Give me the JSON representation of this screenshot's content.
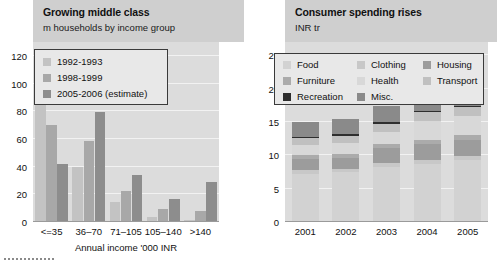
{
  "chart_data": [
    {
      "type": "bar",
      "panel": "left",
      "title": "Growing middle class",
      "subtitle": "m households by income group",
      "xlabel": "Annual income '000 INR",
      "ylabel": "",
      "ylim": [
        0,
        130
      ],
      "yticks": [
        0,
        20,
        40,
        60,
        80,
        100,
        120
      ],
      "grid": true,
      "legend_position": "top-left",
      "categories": [
        "<=35",
        "36–70",
        "71–105",
        "105–140",
        ">140"
      ],
      "series": [
        {
          "name": "1992-1993",
          "color": "#c3c3c3",
          "values": [
            92,
            39,
            14,
            3,
            1
          ]
        },
        {
          "name": "1998-1999",
          "color": "#a8a8a8",
          "values": [
            69,
            58,
            22,
            9,
            7
          ]
        },
        {
          "name": "2005-2006 (estimate)",
          "color": "#8d8d8d",
          "values": [
            41,
            79,
            33,
            16,
            28
          ]
        }
      ]
    },
    {
      "type": "bar",
      "panel": "right",
      "stacked": true,
      "title": "Consumer spending rises",
      "subtitle": "INR tr",
      "xlabel": "",
      "ylabel": "",
      "ylim": [
        0,
        27
      ],
      "yticks": [
        0,
        5,
        10,
        15,
        20,
        25
      ],
      "grid": true,
      "legend_position": "top",
      "categories": [
        "2001",
        "2002",
        "2003",
        "2004",
        "2005"
      ],
      "series": [
        {
          "name": "Food",
          "color": "#d2d2d2",
          "values": [
            7.1,
            7.3,
            8.1,
            8.6,
            9.1
          ]
        },
        {
          "name": "Clothing",
          "color": "#c8c8c8",
          "values": [
            0.5,
            0.5,
            0.6,
            0.6,
            0.6
          ]
        },
        {
          "name": "Housing",
          "color": "#9c9c9c",
          "values": [
            1.7,
            1.7,
            2.2,
            2.3,
            2.4
          ]
        },
        {
          "name": "Furniture",
          "color": "#ababab",
          "values": [
            0.6,
            0.6,
            0.7,
            0.7,
            0.8
          ]
        },
        {
          "name": "Health",
          "color": "#d8d8d8",
          "values": [
            1.5,
            1.6,
            1.8,
            2.8,
            2.8
          ]
        },
        {
          "name": "Transport",
          "color": "#c0c0c0",
          "values": [
            1.0,
            1.1,
            1.2,
            1.3,
            1.4
          ]
        },
        {
          "name": "Recreation",
          "color": "#2e2e2e",
          "values": [
            0.2,
            0.2,
            0.2,
            0.2,
            0.2
          ]
        },
        {
          "name": "Misc.",
          "color": "#8a8a8a",
          "values": [
            2.2,
            2.3,
            2.5,
            2.3,
            3.0
          ]
        }
      ],
      "totals": [
        14.8,
        15.3,
        17.3,
        18.8,
        20.3
      ]
    }
  ],
  "left_panel": {
    "title": "Growing middle class",
    "subtitle": "m households by income group",
    "axis_label": "Annual income '000 INR"
  },
  "right_panel": {
    "title": "Consumer spending rises",
    "subtitle": "INR tr"
  }
}
